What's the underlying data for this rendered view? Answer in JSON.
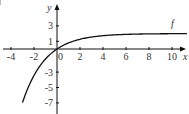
{
  "chart_data": {
    "type": "line",
    "title": "",
    "xlabel": "x",
    "ylabel": "y",
    "series": [
      {
        "name": "f",
        "label": "f",
        "x": [
          -3,
          -2,
          -1,
          0,
          1,
          2,
          3,
          4,
          5,
          6,
          7,
          8,
          9,
          10,
          11
        ],
        "values": [
          -6.96,
          -3.44,
          -1.3,
          0,
          0.79,
          1.26,
          1.55,
          1.73,
          1.84,
          1.9,
          1.94,
          1.96,
          1.98,
          1.99,
          1.99
        ]
      }
    ],
    "x_ticks": [
      -4,
      -2,
      0,
      2,
      4,
      6,
      8,
      10
    ],
    "x_tick_labels": [
      "-4",
      "-2",
      "0",
      "2",
      "4",
      "6",
      "8",
      "10"
    ],
    "y_ticks": [
      3,
      1,
      -3,
      -5,
      -7
    ],
    "y_tick_labels": [
      "3",
      "1",
      "-3",
      "-5",
      "-7"
    ],
    "xlim": [
      -4.5,
      11.3
    ],
    "ylim": [
      -8,
      5.5
    ],
    "grid": false,
    "legend": "inline label 'f' near curve end",
    "color": "#111111"
  }
}
